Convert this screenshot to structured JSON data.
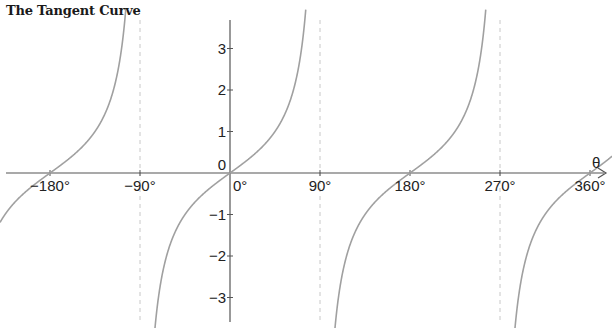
{
  "chart_data": {
    "type": "line",
    "title": "The Tangent Curve",
    "function": "y = tan(θ)",
    "xlabel": "θ",
    "ylabel": "",
    "xlim": [
      -230,
      382
    ],
    "ylim": [
      -3.7,
      4.1
    ],
    "x_ticks": [
      -180,
      -90,
      0,
      90,
      180,
      270,
      360
    ],
    "x_tick_labels": [
      "−180°",
      "−90°",
      "0°",
      "90°",
      "180°",
      "270°",
      "360°"
    ],
    "y_ticks": [
      -3,
      -2,
      -1,
      0,
      1,
      2,
      3
    ],
    "y_tick_labels": [
      "−3",
      "−2",
      "−1",
      "0",
      "1",
      "2",
      "3"
    ],
    "asymptotes": [
      -90,
      90,
      270
    ],
    "asymptote_style": "dashed",
    "zeros": [
      -180,
      0,
      180,
      360
    ],
    "series": [
      {
        "name": "tan θ",
        "x": [
          -225,
          -180,
          -135,
          -90,
          -45,
          0,
          45,
          90,
          135,
          180,
          225,
          270,
          315,
          360,
          382
        ],
        "values": [
          -1,
          0,
          1,
          null,
          -1,
          0,
          1,
          null,
          -1,
          0,
          1,
          null,
          -1,
          0,
          0.4
        ]
      }
    ],
    "grid": false,
    "legend": "none",
    "colors": {
      "curve": "#a0a0a0",
      "axis": "#555555",
      "asymptote": "#c8c8c8"
    }
  }
}
